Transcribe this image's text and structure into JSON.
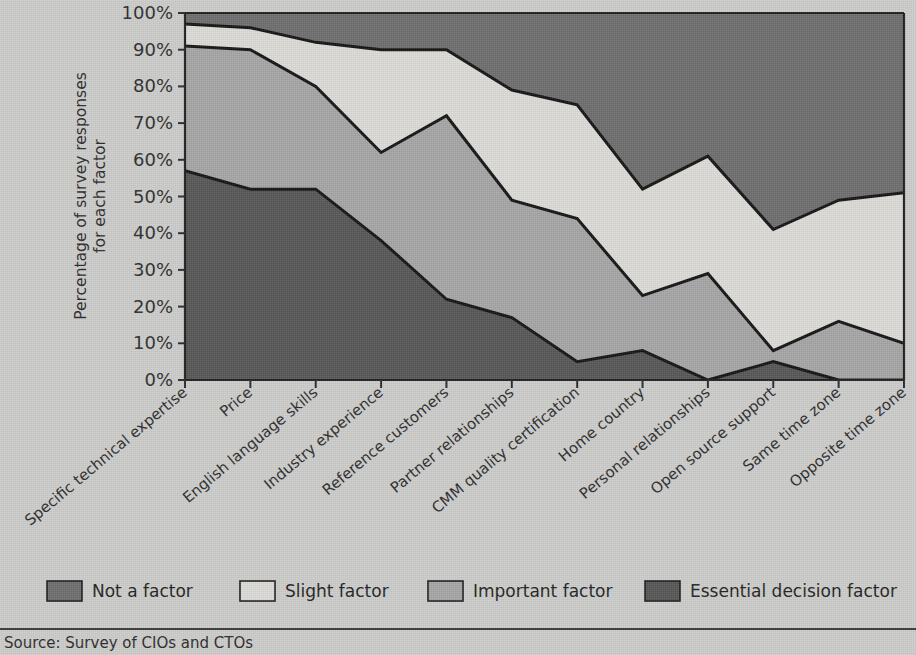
{
  "chart_data": {
    "type": "area",
    "stacked": true,
    "title": "",
    "xlabel": "",
    "ylabel": "Percentage of survey responses for each factor",
    "ylim": [
      0,
      100
    ],
    "ytick_labels": [
      "0%",
      "10%",
      "20%",
      "30%",
      "40%",
      "50%",
      "60%",
      "70%",
      "80%",
      "90%",
      "100%"
    ],
    "ytick_values": [
      0,
      10,
      20,
      30,
      40,
      50,
      60,
      70,
      80,
      90,
      100
    ],
    "grid": false,
    "legend_position": "bottom",
    "categories": [
      "Specific technical expertise",
      "Price",
      "English language skills",
      "Industry experience",
      "Reference customers",
      "Partner relationships",
      "CMM quality certification",
      "Home country",
      "Personal relationships",
      "Open source support",
      "Same time zone",
      "Opposite time zone"
    ],
    "series": [
      {
        "name": "Essential decision factor",
        "color": "#575757",
        "values": [
          57,
          52,
          52,
          38,
          22,
          17,
          5,
          8,
          0,
          5,
          0,
          0
        ]
      },
      {
        "name": "Important factor",
        "color": "#a6a6a6",
        "values": [
          34,
          38,
          28,
          24,
          50,
          32,
          39,
          15,
          29,
          3,
          16,
          10
        ]
      },
      {
        "name": "Slight factor",
        "color": "#dddcd8",
        "values": [
          6,
          6,
          12,
          28,
          18,
          30,
          31,
          29,
          32,
          33,
          33,
          41
        ]
      },
      {
        "name": "Not a factor",
        "color": "#6e6e6e",
        "values": [
          3,
          4,
          8,
          10,
          10,
          21,
          25,
          48,
          39,
          59,
          51,
          49
        ]
      }
    ],
    "cumulative_upper_bounds": {
      "essential": [
        57,
        52,
        52,
        38,
        22,
        17,
        5,
        8,
        0,
        5,
        0,
        0
      ],
      "essential_plus_important": [
        91,
        90,
        80,
        62,
        72,
        49,
        44,
        23,
        29,
        8,
        16,
        10
      ],
      "essential_plus_important_plus_slight": [
        97,
        96,
        92,
        90,
        90,
        79,
        75,
        52,
        61,
        41,
        49,
        51
      ],
      "total": [
        100,
        100,
        100,
        100,
        100,
        100,
        100,
        100,
        100,
        100,
        100,
        100
      ]
    },
    "legend": [
      {
        "label": "Not a factor",
        "color": "#6e6e6e"
      },
      {
        "label": "Slight factor",
        "color": "#dddcd8"
      },
      {
        "label": "Important factor",
        "color": "#a6a6a6"
      },
      {
        "label": "Essential decision factor",
        "color": "#575757"
      }
    ]
  },
  "source": {
    "text": "Source: Survey of CIOs and CTOs"
  }
}
